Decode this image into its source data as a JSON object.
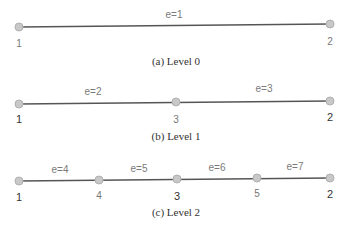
{
  "diagram": {
    "levels": [
      {
        "caption": "(a) Level 0",
        "edges": [
          {
            "label": "e=1"
          }
        ],
        "nodes": [
          {
            "label": "1"
          },
          {
            "label": "2"
          }
        ]
      },
      {
        "caption": "(b) Level 1",
        "edges": [
          {
            "label": "e=2"
          },
          {
            "label": "e=3"
          }
        ],
        "nodes": [
          {
            "label": "1"
          },
          {
            "label": "3"
          },
          {
            "label": "2"
          }
        ]
      },
      {
        "caption": "(c) Level 2",
        "edges": [
          {
            "label": "e=4"
          },
          {
            "label": "e=5"
          },
          {
            "label": "e=6"
          },
          {
            "label": "e=7"
          }
        ],
        "nodes": [
          {
            "label": "1"
          },
          {
            "label": "4"
          },
          {
            "label": "3"
          },
          {
            "label": "5"
          },
          {
            "label": "2"
          }
        ]
      }
    ],
    "colors": {
      "line": "#555555",
      "node_fill": "#c8c8c8",
      "node_stroke": "#b0b0b0"
    }
  }
}
